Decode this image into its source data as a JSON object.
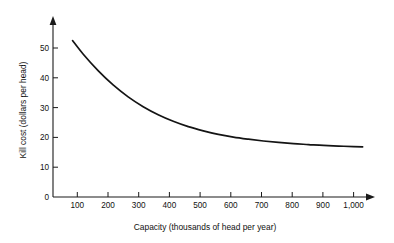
{
  "chart_data": {
    "type": "line",
    "title": "",
    "subtitle": "",
    "xlabel": "Capacity (thousands of head per year)",
    "ylabel": "Kill cost (dollars per head)",
    "xlim": [
      0,
      1130
    ],
    "ylim": [
      0,
      57
    ],
    "grid": false,
    "legend": null,
    "x_ticks": [
      100,
      200,
      300,
      400,
      500,
      600,
      700,
      800,
      900,
      1000
    ],
    "x_tick_labels": [
      "100",
      "200",
      "300",
      "400",
      "500",
      "600",
      "700",
      "800",
      "900",
      "1,000"
    ],
    "y_ticks": [
      0,
      10,
      20,
      30,
      40,
      50
    ],
    "y_tick_labels": [
      "0",
      "10",
      "20",
      "30",
      "40",
      "50"
    ],
    "origin_label": "0",
    "series": [
      {
        "name": "Kill cost",
        "color": "#141414",
        "x": [
          65,
          100,
          150,
          200,
          250,
          300,
          350,
          400,
          450,
          500,
          550,
          600,
          650,
          700,
          750,
          800,
          850,
          900,
          950,
          1000,
          1030
        ],
        "values": [
          52.5,
          48.0,
          42.4,
          37.6,
          33.6,
          30.3,
          27.6,
          25.4,
          23.6,
          22.2,
          21.0,
          20.1,
          19.4,
          18.8,
          18.3,
          17.9,
          17.6,
          17.3,
          17.1,
          16.9,
          16.8
        ]
      }
    ]
  },
  "axes": {
    "x_axis_name": "capacity-axis",
    "y_axis_name": "kill-cost-axis"
  }
}
